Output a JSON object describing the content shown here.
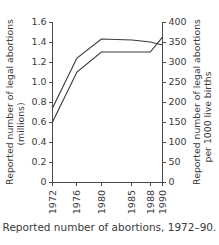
{
  "caption": "Reported number of abortions, 1972–90.",
  "chart_data": {
    "type": "line",
    "title": "",
    "subtitle": "",
    "xlabel": "",
    "ylabel": "Reported number of legal abortions (millions)",
    "ylabel_line1": "Reported number of legal abortions",
    "ylabel_line2": "(millions)",
    "y2label": "Reported number of legal abortions per 1000 live births",
    "y2label_line1": "Reported number of legal abortions",
    "y2label_line2": "per 1000 live births",
    "x": [
      1972,
      1976,
      1980,
      1985,
      1988,
      1990
    ],
    "xtick_labels": [
      "1972",
      "1976",
      "1980",
      "1985",
      "1988",
      "1990"
    ],
    "xlim": [
      1972,
      1990
    ],
    "ylim": [
      0,
      1.6
    ],
    "ytick_labels": [
      "0",
      "0.2",
      "0.4",
      "0.6",
      "0.8",
      "1.0",
      "1.2",
      "1.4",
      "1.6"
    ],
    "ytick_values": [
      0,
      0.2,
      0.4,
      0.6,
      0.8,
      1.0,
      1.2,
      1.4,
      1.6
    ],
    "y2lim": [
      0,
      400
    ],
    "y2tick_labels": [
      "0",
      "50",
      "100",
      "150",
      "200",
      "250",
      "300",
      "350",
      "400"
    ],
    "y2tick_values": [
      0,
      50,
      100,
      150,
      200,
      250,
      300,
      350,
      400
    ],
    "grid": false,
    "legend": "none",
    "line_color": "#3c3c3c",
    "axis_color": "#4a4a4a",
    "background": "#ffffff",
    "series": [
      {
        "name": "Number of legal abortions (millions)",
        "axis": "left",
        "values": [
          0.74,
          1.24,
          1.43,
          1.42,
          1.4,
          1.37
        ]
      },
      {
        "name": "Legal abortions per 1000 live births",
        "axis": "right",
        "values": [
          150,
          275,
          325,
          325,
          325,
          362
        ],
        "values_in_left_units": [
          0.6,
          1.1,
          1.3,
          1.3,
          1.3,
          1.45
        ]
      }
    ]
  }
}
